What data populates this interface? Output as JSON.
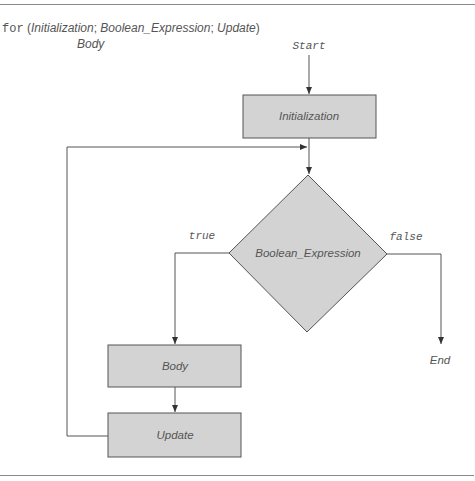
{
  "syntax": {
    "keyword": "for",
    "open": " (",
    "init": "Initialization",
    "sep1": "; ",
    "cond": "Boolean_Expression",
    "sep2": "; ",
    "update": "Update",
    "close": ")",
    "body": "Body"
  },
  "flowchart": {
    "start": "Start",
    "end": "End",
    "nodes": {
      "initialization": "Initialization",
      "condition": "Boolean_Expression",
      "body": "Body",
      "update": "Update"
    },
    "edges": {
      "true_label": "true",
      "false_label": "false"
    },
    "colors": {
      "fill": "#d3d3d3",
      "stroke": "#555555",
      "text": "#555555"
    }
  }
}
